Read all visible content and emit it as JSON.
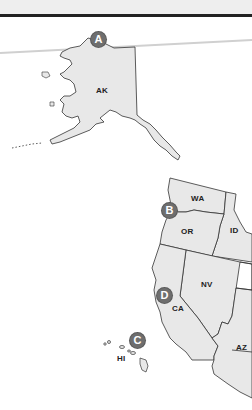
{
  "map": {
    "fill_color": "#e8e8e8",
    "stroke_color": "#333333",
    "marker_color": "#6e6e6e",
    "states": [
      {
        "abbr": "AK",
        "name": "Alaska"
      },
      {
        "abbr": "WA",
        "name": "Washington"
      },
      {
        "abbr": "OR",
        "name": "Oregon"
      },
      {
        "abbr": "ID",
        "name": "Idaho"
      },
      {
        "abbr": "NV",
        "name": "Nevada"
      },
      {
        "abbr": "CA",
        "name": "California"
      },
      {
        "abbr": "AZ",
        "name": "Arizona"
      },
      {
        "abbr": "HI",
        "name": "Hawaii"
      }
    ],
    "markers": [
      {
        "letter": "A",
        "near": "AK"
      },
      {
        "letter": "B",
        "near": "WA/OR coast"
      },
      {
        "letter": "C",
        "near": "HI"
      },
      {
        "letter": "D",
        "near": "CA"
      }
    ]
  }
}
